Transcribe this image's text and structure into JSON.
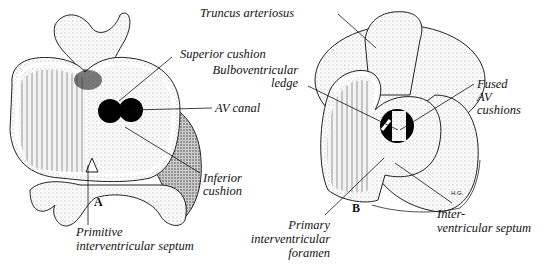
{
  "figure": {
    "panels": [
      {
        "id": "A",
        "label": "A",
        "annotations": {
          "superior_cushion": "Superior cushion",
          "av_canal": "AV canal",
          "inferior_cushion_1": "Inferior",
          "inferior_cushion_2": "cushion",
          "primitive_septum_1": "Primitive",
          "primitive_septum_2": "interventricular septum"
        }
      },
      {
        "id": "B",
        "label": "B",
        "annotations": {
          "truncus": "Truncus arteriosus",
          "bulbo_1": "Bulboventricular",
          "bulbo_2": "ledge",
          "fused_1": "Fused",
          "fused_2": "AV",
          "fused_3": "cushions",
          "primary_1": "Primary",
          "primary_2": "interventricular",
          "primary_3": "foramen",
          "iv_septum_1": "Inter-",
          "iv_septum_2": "ventricular septum"
        },
        "signature": "H.G."
      }
    ]
  }
}
